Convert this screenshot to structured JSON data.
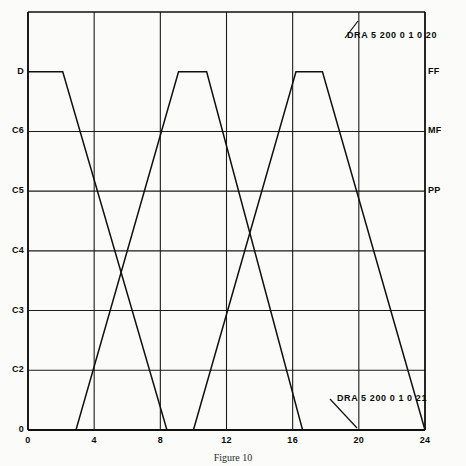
{
  "figure": {
    "caption": "Figure 10",
    "caption_y": 452
  },
  "chart_data": {
    "type": "line",
    "title": "Figure 10",
    "xlabel": "",
    "ylabel": "",
    "grid": true,
    "legend": "none",
    "xlim": [
      0,
      24
    ],
    "ylim": [
      0,
      7
    ],
    "x_ticks": [
      "0",
      "4",
      "8",
      "12",
      "16",
      "20",
      "24"
    ],
    "x_tick_values": [
      0,
      4,
      8,
      12,
      16,
      20,
      24
    ],
    "y_ticks_left": [
      "0",
      "C2",
      "C3",
      "C4",
      "C5",
      "C6",
      "D"
    ],
    "y_tick_values": [
      0,
      1,
      2,
      3,
      4,
      5,
      6
    ],
    "y_ticks_right": [
      "PP",
      "MF",
      "FF"
    ],
    "y_tick_right_values": [
      4,
      5,
      6
    ],
    "series": [
      {
        "name": "trace-1",
        "comment": "descending-then-rising sawtooth starting at top-left",
        "x": [
          0.0,
          2.1,
          8.4,
          10.0,
          16.2,
          17.8,
          24.0
        ],
        "y": [
          6.0,
          6.0,
          0.0,
          0.0,
          6.0,
          6.0,
          0.0
        ]
      },
      {
        "name": "trace-2",
        "comment": "rising-then-descending sawtooth starting at bottom-left",
        "x": [
          0.0,
          2.9,
          9.1,
          10.8,
          16.6,
          19.6,
          24.0
        ],
        "y": [
          0.0,
          0.0,
          6.0,
          6.0,
          0.0,
          0.0,
          0.0
        ]
      }
    ],
    "crossings": [
      {
        "x": 5.3,
        "y": 3.0
      },
      {
        "x": 14.3,
        "y": 3.0
      }
    ]
  },
  "axes": {
    "left_labels": [
      {
        "text": "D",
        "value": 6
      },
      {
        "text": "C6",
        "value": 5
      },
      {
        "text": "C5",
        "value": 4
      },
      {
        "text": "C4",
        "value": 3
      },
      {
        "text": "C3",
        "value": 2
      },
      {
        "text": "C2",
        "value": 1
      },
      {
        "text": "0",
        "value": 0
      }
    ],
    "right_labels": [
      {
        "text": "FF",
        "value": 6
      },
      {
        "text": "MF",
        "value": 5
      },
      {
        "text": "PP",
        "value": 4
      }
    ],
    "bottom_labels": [
      {
        "text": "0",
        "value": 0
      },
      {
        "text": "4",
        "value": 4
      },
      {
        "text": "8",
        "value": 8
      },
      {
        "text": "12",
        "value": 12
      },
      {
        "text": "16",
        "value": 16
      },
      {
        "text": "20",
        "value": 20
      },
      {
        "text": "24",
        "value": 24
      }
    ]
  },
  "annotations": [
    {
      "id": "annotation-top",
      "text": "DRA 5 200 0 1 0 20",
      "x": 347,
      "y": 31,
      "leader": {
        "x1": 345,
        "y1": 38,
        "x2": 358,
        "y2": 21
      }
    },
    {
      "id": "annotation-bottom",
      "text": "DRA 5 200 0 1 0 21",
      "x": 337,
      "y": 394,
      "leader": {
        "x1": 330,
        "y1": 399,
        "x2": 357,
        "y2": 428
      }
    }
  ],
  "colors": {
    "ink": "#111111",
    "paper": "#fbfbf9",
    "grid": "#1a1a1a"
  }
}
